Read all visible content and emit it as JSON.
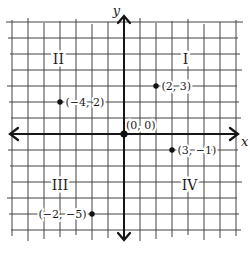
{
  "figure": {
    "background": "#ffffff",
    "grid_color": "#454545",
    "axis_color": "#161616",
    "point_color": "#111111",
    "text_color": "#1c1c1c"
  },
  "chart_data": {
    "type": "scatter",
    "title": "",
    "xlabel": "x",
    "ylabel": "y",
    "xlim": [
      -7,
      7
    ],
    "ylim": [
      -6,
      7
    ],
    "grid": true,
    "points": [
      {
        "x": 2,
        "y": 3,
        "label": "(2, 3)",
        "label_side": "right"
      },
      {
        "x": -4,
        "y": 2,
        "label": "(−4, 2)",
        "label_side": "right"
      },
      {
        "x": 0,
        "y": 0,
        "label": "(0, 0)",
        "label_side": "above-right"
      },
      {
        "x": 3,
        "y": -1,
        "label": "(3, −1)",
        "label_side": "right"
      },
      {
        "x": -2,
        "y": -5,
        "label": "(−2, −5)",
        "label_side": "left"
      }
    ],
    "quadrant_labels": [
      {
        "text": "I",
        "x": 3.85,
        "y": 4.7
      },
      {
        "text": "II",
        "x": -4.1,
        "y": 4.7
      },
      {
        "text": "III",
        "x": -4.0,
        "y": -3.2
      },
      {
        "text": "IV",
        "x": 4.1,
        "y": -3.2
      }
    ]
  }
}
